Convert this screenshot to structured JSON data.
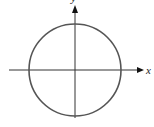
{
  "diagram": {
    "type": "circle-on-axes",
    "x_axis_label": "x",
    "y_axis_label": "y",
    "colors": {
      "circle": "#555555",
      "axes": "#222222",
      "background": "#ffffff"
    },
    "geometry": {
      "origin": [
        75,
        70
      ],
      "circle_radius": 46
    }
  }
}
